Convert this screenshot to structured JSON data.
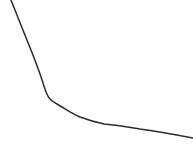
{
  "figure": {
    "title": "",
    "subtitle": "",
    "background_color": "#ffffff",
    "width": 193,
    "height": 158
  },
  "chart_data": {
    "type": "line",
    "title": "",
    "subtitle": "",
    "xlabel": "",
    "ylabel": "",
    "xlim": [
      0,
      193
    ],
    "ylim": [
      0,
      158
    ],
    "grid": false,
    "axes_visible": false,
    "tick_labels_visible": false,
    "legend": null,
    "legend_position": "none",
    "annotations": [],
    "series": [
      {
        "name": "decay-curve",
        "color": "#2b2b2b",
        "line_width": 1.5,
        "style": "solid",
        "markers": "none",
        "description": "monotonic decreasing exponential-style decay with steep initial drop, a knee near x=55, and a long shallow tail",
        "x": [
          11,
          15,
          19,
          25,
          31,
          37,
          42,
          45,
          48,
          51,
          55,
          60,
          65,
          70,
          77,
          85,
          92,
          100,
          110,
          120,
          130,
          140,
          150,
          160,
          172,
          193
        ],
        "y": [
          0,
          10,
          20,
          35,
          50,
          66,
          80,
          88,
          95,
          99,
          102,
          105,
          109,
          113,
          117,
          120,
          122,
          123,
          125,
          126,
          128,
          129,
          130,
          132,
          134,
          138
        ],
        "path_d": "M 11 0 C 17 15, 24 33, 31 50 C 36 63, 40 73, 44 86 C 46 92, 47 96, 50 99 C 53 102, 57 104, 62 107 C 67 110, 73 114, 80 117 C 88 120, 95 122, 104 124 C 115 125, 128 127, 140 129 C 155 131, 172 134, 193 138"
      }
    ]
  },
  "icons": {
    "curve": "line-chart-icon"
  }
}
